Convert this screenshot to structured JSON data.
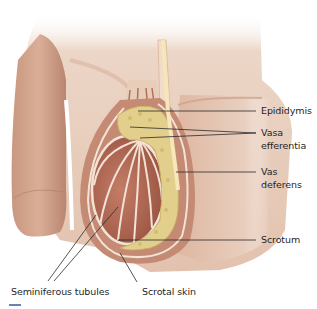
{
  "figure": {
    "colors": {
      "skin": "#e6c7b3",
      "skin_shadow": "#c99a82",
      "tissue": "#b86f5a",
      "tissue_dark": "#8f4b3b",
      "membrane": "#f3e2d6",
      "epididymis": "#e3cf8c",
      "leader_line": "#2a2a2a",
      "accent_bar": "#6d7fb5"
    }
  },
  "labels": {
    "epididymis": "Epididymis",
    "vasa_efferentia_1": "Vasa",
    "vasa_efferentia_2": "efferentia",
    "vas_deferens_1": "Vas",
    "vas_deferens_2": "deferens",
    "scrotum": "Scrotum",
    "seminiferous_tubules": "Seminiferous tubules",
    "scrotal_skin": "Scrotal skin"
  }
}
